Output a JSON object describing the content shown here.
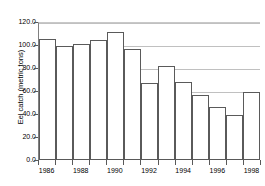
{
  "chart_data": {
    "type": "bar",
    "title": "",
    "subtitle": "",
    "xlabel": "",
    "ylabel": "Eel catch (metric tons)",
    "categories": [
      "1986",
      "1987",
      "1988",
      "1989",
      "1990",
      "1991",
      "1992",
      "1993",
      "1994",
      "1995",
      "1996",
      "1997",
      "1998"
    ],
    "values": [
      105.0,
      99.5,
      100.5,
      104.0,
      111.0,
      96.5,
      67.0,
      82.0,
      67.5,
      56.5,
      46.5,
      39.5,
      59.5
    ],
    "ylim": [
      0.0,
      120.0
    ],
    "y_ticks": [
      0.0,
      20.0,
      40.0,
      60.0,
      80.0,
      100.0,
      120.0
    ],
    "y_tick_labels": [
      "0.0",
      "20.0",
      "40.0",
      "60.0",
      "80.0",
      "100.0",
      "120.0"
    ],
    "x_tick_labels_shown": [
      "1986",
      "1988",
      "1990",
      "1992",
      "1994",
      "1996",
      "1998"
    ],
    "grid": "horizontal",
    "legend": "none",
    "bar_fill_color": "#ffffff",
    "bar_border_color": "#5a5a5a",
    "gridline_color": "#c0c0c0",
    "axis_color": "#595959",
    "background_color": "#ffffff",
    "text_color": "#000000"
  }
}
